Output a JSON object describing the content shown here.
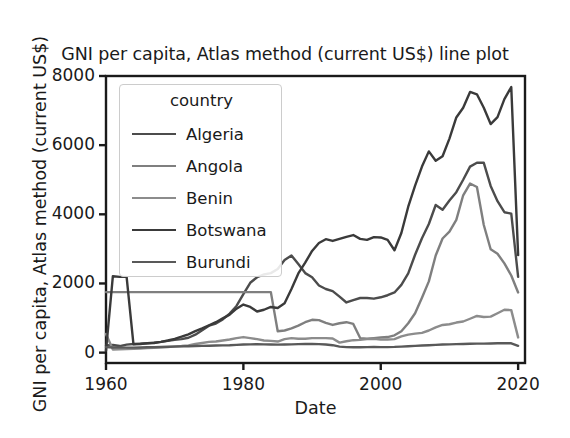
{
  "chart_data": {
    "type": "line",
    "title": "GNI per capita, Atlas method (current US$) line plot",
    "xlabel": "Date",
    "ylabel": "GNI per capita, Atlas method (current US$)",
    "legend_title": "country",
    "legend_position": "upper-left-inside",
    "grid": false,
    "xlim": [
      1960,
      2021
    ],
    "ylim": [
      -300,
      8000
    ],
    "xticks": [
      1960,
      1980,
      2000,
      2020
    ],
    "xtick_labels": [
      "1960",
      "1980",
      "2000",
      "2020"
    ],
    "yticks": [
      0,
      2000,
      4000,
      6000,
      8000
    ],
    "ytick_labels": [
      "0",
      "2000",
      "4000",
      "6000",
      "8000"
    ],
    "x": [
      1960,
      1961,
      1962,
      1963,
      1964,
      1965,
      1966,
      1967,
      1968,
      1969,
      1970,
      1971,
      1972,
      1973,
      1974,
      1975,
      1976,
      1977,
      1978,
      1979,
      1980,
      1981,
      1982,
      1983,
      1984,
      1985,
      1986,
      1987,
      1988,
      1989,
      1990,
      1991,
      1992,
      1993,
      1994,
      1995,
      1996,
      1997,
      1998,
      1999,
      2000,
      2001,
      2002,
      2003,
      2004,
      2005,
      2006,
      2007,
      2008,
      2009,
      2010,
      2011,
      2012,
      2013,
      2014,
      2015,
      2016,
      2017,
      2018,
      2019,
      2020
    ],
    "series": [
      {
        "name": "Algeria",
        "color": "#4c4c4c",
        "linewidth": 2.4,
        "values": [
          210,
          220,
          190,
          230,
          250,
          260,
          270,
          290,
          310,
          340,
          370,
          390,
          430,
          520,
          650,
          780,
          840,
          960,
          1130,
          1350,
          1690,
          2020,
          2180,
          2260,
          2300,
          2420,
          2680,
          2810,
          2560,
          2300,
          2180,
          1940,
          1840,
          1780,
          1620,
          1450,
          1520,
          1580,
          1580,
          1560,
          1600,
          1660,
          1740,
          1960,
          2290,
          2830,
          3310,
          3720,
          4270,
          4130,
          4400,
          4640,
          5000,
          5380,
          5490,
          5490,
          4820,
          4380,
          4060,
          4020,
          2190
        ]
      },
      {
        "name": "Angola",
        "color": "#7f7f7f",
        "linewidth": 2.4,
        "values": [
          1750,
          1750,
          1750,
          1750,
          1750,
          1750,
          1750,
          1750,
          1750,
          1750,
          1750,
          1750,
          1750,
          1750,
          1750,
          1750,
          1750,
          1750,
          1750,
          1750,
          1750,
          1750,
          1750,
          1750,
          1750,
          620,
          640,
          700,
          780,
          880,
          950,
          940,
          860,
          800,
          850,
          880,
          830,
          420,
          400,
          420,
          440,
          450,
          500,
          620,
          850,
          1140,
          1590,
          2060,
          2810,
          3300,
          3500,
          3840,
          4550,
          4890,
          4790,
          3690,
          2990,
          2860,
          2580,
          2230,
          1740
        ]
      },
      {
        "name": "Benin",
        "color": "#8c8c8c",
        "linewidth": 2.4,
        "values": [
          540,
          90,
          95,
          100,
          110,
          120,
          130,
          140,
          150,
          160,
          180,
          190,
          210,
          250,
          280,
          310,
          320,
          350,
          380,
          420,
          450,
          420,
          390,
          350,
          340,
          320,
          390,
          420,
          400,
          400,
          420,
          420,
          420,
          410,
          290,
          330,
          360,
          370,
          390,
          400,
          380,
          380,
          390,
          470,
          520,
          550,
          570,
          640,
          730,
          800,
          820,
          870,
          900,
          980,
          1060,
          1030,
          1040,
          1140,
          1240,
          1230,
          440
        ]
      },
      {
        "name": "Botswana",
        "color": "#3a3a3a",
        "linewidth": 2.4,
        "values": [
          60,
          2210,
          2190,
          2190,
          240,
          250,
          270,
          280,
          310,
          350,
          400,
          460,
          530,
          620,
          700,
          790,
          880,
          990,
          1100,
          1270,
          1390,
          1320,
          1190,
          1240,
          1320,
          1290,
          1430,
          1840,
          2290,
          2600,
          2940,
          3170,
          3280,
          3230,
          3290,
          3350,
          3400,
          3290,
          3260,
          3340,
          3330,
          3260,
          2960,
          3460,
          4220,
          4830,
          5380,
          5820,
          5550,
          5680,
          6190,
          6800,
          7080,
          7540,
          7470,
          7080,
          6610,
          6810,
          7330,
          7680,
          2820
        ]
      },
      {
        "name": "Burundi",
        "color": "#595959",
        "linewidth": 2.4,
        "values": [
          160,
          150,
          150,
          145,
          145,
          150,
          155,
          160,
          165,
          170,
          175,
          180,
          185,
          190,
          195,
          200,
          205,
          210,
          215,
          225,
          235,
          240,
          245,
          240,
          235,
          230,
          235,
          240,
          245,
          250,
          250,
          245,
          235,
          215,
          175,
          160,
          155,
          155,
          160,
          165,
          160,
          160,
          165,
          175,
          185,
          195,
          205,
          215,
          225,
          235,
          240,
          245,
          250,
          255,
          260,
          260,
          265,
          270,
          270,
          270,
          195
        ]
      }
    ]
  }
}
